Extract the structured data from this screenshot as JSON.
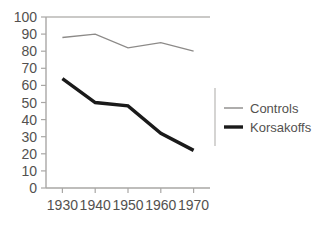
{
  "chart_data": {
    "type": "line",
    "title": "",
    "xlabel": "",
    "ylabel": "",
    "categories": [
      "1930",
      "1940",
      "1950",
      "1960",
      "1970"
    ],
    "x": [
      1930,
      1940,
      1950,
      1960,
      1970
    ],
    "xlim": [
      1925,
      1975
    ],
    "ylim": [
      0,
      100
    ],
    "ytick_labels": [
      "0",
      "10",
      "20",
      "30",
      "40",
      "50",
      "60",
      "70",
      "80",
      "90",
      "100"
    ],
    "yticks": [
      0,
      10,
      20,
      30,
      40,
      50,
      60,
      70,
      80,
      90,
      100
    ],
    "xtick_labels": [
      "1930",
      "1940",
      "1950",
      "1960",
      "1970"
    ],
    "grid": false,
    "legend_position": "right",
    "series": [
      {
        "name": "Controls",
        "values": [
          88,
          90,
          82,
          85,
          80
        ],
        "color": "#8c8a88",
        "line_width": 1.3,
        "style": "thin-gray"
      },
      {
        "name": "Korsakoffs",
        "values": [
          64,
          50,
          48,
          32,
          22
        ],
        "color": "#1a1a1a",
        "line_width": 3.4,
        "style": "thick-black"
      }
    ]
  },
  "legend": {
    "entries": [
      {
        "label": "Controls"
      },
      {
        "label": "Korsakoffs"
      }
    ]
  },
  "colors": {
    "background": "#ffffff",
    "axis": "#a9a7a5",
    "frame": "#b9b7b5",
    "text": "#53514f",
    "controls": "#8c8a88",
    "korsakoffs": "#1a1a1a"
  }
}
